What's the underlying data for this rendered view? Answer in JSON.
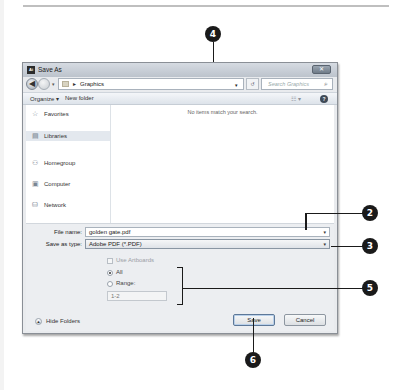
{
  "page": {
    "top_rule": true
  },
  "dialog": {
    "title": "Save As",
    "app_icon_text": "Ai",
    "close_symbol": "✕",
    "navbar": {
      "back_symbol": "◀",
      "address_separator": "▸",
      "address_path": "Graphics",
      "address_dropdown": "▾",
      "refresh_symbol": "↺",
      "search_placeholder": "Search Graphics",
      "search_symbol": "⌕"
    },
    "toolbar": {
      "organize_label": "Organize ▾",
      "new_folder_label": "New folder",
      "views_label": "☷ ▾",
      "help_label": "?"
    },
    "sidebar": {
      "items": [
        {
          "label": "Favorites",
          "icon": "☆"
        },
        {
          "label": "Libraries",
          "icon": "▤"
        },
        {
          "label": "Homegroup",
          "icon": "⚇"
        },
        {
          "label": "Computer",
          "icon": "▣"
        },
        {
          "label": "Network",
          "icon": "⛁"
        }
      ]
    },
    "content": {
      "empty_message": "No items match your search."
    },
    "form": {
      "file_name_label": "File name:",
      "file_name_value": "golden gate.pdf",
      "save_type_label": "Save as type:",
      "save_type_value": "Adobe PDF (*.PDF)",
      "dropdown_symbol": "▾",
      "use_artboards_label": "Use Artboards",
      "all_label": "All",
      "range_label": "Range:",
      "range_value": "1-2"
    },
    "footer": {
      "hide_folders_label": "Hide Folders",
      "hide_folders_symbol": "▲",
      "save_label": "Save",
      "cancel_label": "Cancel"
    }
  },
  "callouts": [
    {
      "number": "2"
    },
    {
      "number": "3"
    },
    {
      "number": "4"
    },
    {
      "number": "5"
    },
    {
      "number": "6"
    }
  ]
}
